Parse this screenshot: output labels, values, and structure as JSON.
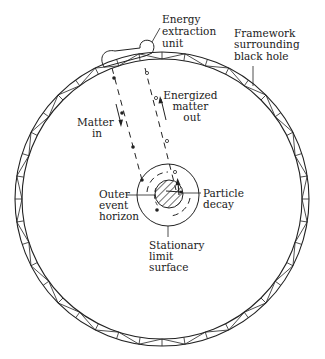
{
  "diagram": {
    "type": "schematic",
    "labels": {
      "energy_extraction_unit": [
        "Energy",
        "extraction",
        "unit"
      ],
      "framework": [
        "Framework",
        "surrounding",
        "black hole"
      ],
      "energized_matter_out": [
        "Energized",
        "matter",
        "out"
      ],
      "matter_in": [
        "Matter",
        "in"
      ],
      "outer_event_horizon": [
        "Outer",
        "event",
        "horizon"
      ],
      "particle_decay": [
        "Particle",
        "decay"
      ],
      "stationary_limit_surface": [
        "Stationary",
        "limit",
        "surface"
      ]
    },
    "colors": {
      "line": "#222222",
      "background": "#ffffff"
    }
  }
}
